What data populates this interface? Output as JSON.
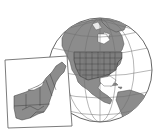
{
  "figure": {
    "colors": {
      "background": "#ffffff",
      "land": "#8c8c8c",
      "outline": "#3a3a3a",
      "grid": "#6e6e6e",
      "inset_frame": "#5a5a5a",
      "inset_bg": "#ffffff"
    }
  }
}
